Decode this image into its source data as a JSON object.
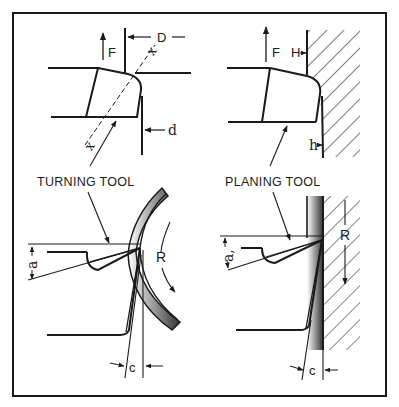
{
  "figure": {
    "type": "engineering-diagram",
    "panels": [
      {
        "id": "turning-top",
        "view": "top view",
        "labels": {
          "feed": "F",
          "depth_of_work": "D",
          "depth_of_cut": "d",
          "axis": "x"
        }
      },
      {
        "id": "planing-top",
        "view": "top view",
        "labels": {
          "feed": "F",
          "work_height_top": "H",
          "work_height_bottom": "h"
        }
      },
      {
        "id": "turning-side",
        "view": "side view",
        "labels": {
          "rake_angle": "a",
          "rotation": "R",
          "clearance": "c"
        }
      },
      {
        "id": "planing-side",
        "view": "side view",
        "labels": {
          "rake_angle": "a,",
          "travel": "R",
          "clearance": "c"
        }
      }
    ],
    "captions": {
      "turning": "TURNING TOOL",
      "planing": "PLANING TOOL"
    },
    "colors": {
      "ink": "#1a1a1a",
      "paper": "#ffffff"
    }
  }
}
